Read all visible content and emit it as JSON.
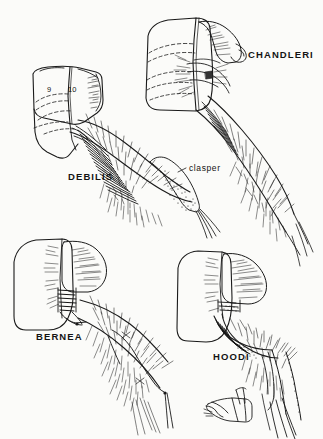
{
  "plate": {
    "type": "scientific-illustration",
    "subject": "insect terminalia / genitalia lateral views",
    "background_color": "#fbfbf9",
    "ink_color": "#1a1a1a",
    "width": 323,
    "height": 439
  },
  "labels": {
    "species": [
      {
        "key": "debilis",
        "text": "DEBILIS"
      },
      {
        "key": "chandleri",
        "text": "CHANDLERI"
      },
      {
        "key": "bernea",
        "text": "BERNEA"
      },
      {
        "key": "hoodi",
        "text": "HOODI"
      }
    ],
    "parts": [
      {
        "key": "clasper",
        "text": "clasper"
      }
    ],
    "segments": [
      {
        "key": "seg9",
        "text": "9"
      },
      {
        "key": "seg10",
        "text": "10"
      }
    ]
  },
  "figures": [
    {
      "id": "debilis",
      "label": "DEBILIS",
      "position": "upper-left",
      "annotations": [
        "9",
        "10"
      ],
      "features": "segmented abdominal plate with dashed internal outlines, hairy tapering clasper"
    },
    {
      "id": "chandleri",
      "label": "CHANDLERI",
      "position": "upper-right",
      "annotations": [],
      "features": "broad basal plate, hooked apical lobe, long setose appendage"
    },
    {
      "id": "bernea",
      "label": "BERNEA",
      "position": "lower-left",
      "annotations": [],
      "features": "rounded basal plate, ribbed joint, elongate setose clasper with terminal spines"
    },
    {
      "id": "hoodi",
      "label": "HOODI",
      "position": "lower-right",
      "annotations": [],
      "features": "angular basal plate, curved dark inner margin, detached accessory sclerite below"
    }
  ]
}
